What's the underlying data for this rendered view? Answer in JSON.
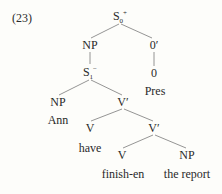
{
  "example_number": "(23)",
  "tree": {
    "root": {
      "cat": "S",
      "sub": "0",
      "sup": "+"
    },
    "np_subj": {
      "cat": "NP"
    },
    "zero_bar": {
      "cat": "0′"
    },
    "s1": {
      "cat": "S",
      "sub": "1",
      "sup": "−"
    },
    "zero": {
      "cat": "0"
    },
    "pres": {
      "word": "Pres"
    },
    "np_ann": {
      "cat": "NP"
    },
    "vbar_top": {
      "cat": "V′"
    },
    "ann": {
      "word": "Ann"
    },
    "v_have": {
      "cat": "V"
    },
    "vbar_low": {
      "cat": "V′"
    },
    "have": {
      "word": "have"
    },
    "v_finish": {
      "cat": "V"
    },
    "np_obj": {
      "cat": "NP"
    },
    "finish": {
      "word": "finish-en"
    },
    "report": {
      "word": "the report"
    }
  }
}
